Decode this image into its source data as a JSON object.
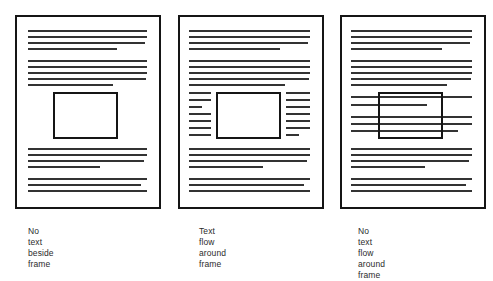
{
  "figure": {
    "type": "diagram",
    "background_color": "#ffffff",
    "line_color": "#333333",
    "border_color": "#151515",
    "panel_count": 3
  },
  "panels": [
    {
      "id": "panel-no-text-beside-frame",
      "caption": "No text beside\nframe",
      "caption_text": "No text beside frame",
      "page": {
        "x": 15,
        "y": 15,
        "width": 146,
        "height": 194
      },
      "frame": {
        "x": 53,
        "y": 92,
        "width": 65,
        "height": 47,
        "filled": true
      },
      "wrap_mode": "none-beside",
      "lines": [
        {
          "x": 28,
          "y": 30,
          "width": 119
        },
        {
          "x": 28,
          "y": 36,
          "width": 119
        },
        {
          "x": 28,
          "y": 42,
          "width": 117
        },
        {
          "x": 28,
          "y": 48,
          "width": 89
        },
        {
          "x": 28,
          "y": 60,
          "width": 119
        },
        {
          "x": 28,
          "y": 66,
          "width": 119
        },
        {
          "x": 28,
          "y": 72,
          "width": 119
        },
        {
          "x": 28,
          "y": 78,
          "width": 118
        },
        {
          "x": 28,
          "y": 84,
          "width": 85
        },
        {
          "x": 28,
          "y": 148,
          "width": 119
        },
        {
          "x": 28,
          "y": 154,
          "width": 119
        },
        {
          "x": 28,
          "y": 160,
          "width": 116
        },
        {
          "x": 28,
          "y": 166,
          "width": 72
        },
        {
          "x": 28,
          "y": 178,
          "width": 119
        },
        {
          "x": 28,
          "y": 184,
          "width": 113
        },
        {
          "x": 28,
          "y": 190,
          "width": 119
        }
      ]
    },
    {
      "id": "panel-text-flow-around-frame",
      "caption": "Text flow around\nframe",
      "caption_text": "Text flow around frame",
      "page": {
        "x": 178,
        "y": 15,
        "width": 146,
        "height": 194
      },
      "frame": {
        "x": 216,
        "y": 92,
        "width": 65,
        "height": 47,
        "filled": true
      },
      "wrap_mode": "around",
      "lines": [
        {
          "x": 189,
          "y": 30,
          "width": 121
        },
        {
          "x": 189,
          "y": 36,
          "width": 121
        },
        {
          "x": 189,
          "y": 42,
          "width": 119
        },
        {
          "x": 189,
          "y": 48,
          "width": 91
        },
        {
          "x": 189,
          "y": 60,
          "width": 121
        },
        {
          "x": 189,
          "y": 66,
          "width": 121
        },
        {
          "x": 189,
          "y": 72,
          "width": 121
        },
        {
          "x": 189,
          "y": 78,
          "width": 120
        },
        {
          "x": 189,
          "y": 84,
          "width": 96
        },
        {
          "x": 189,
          "y": 92,
          "width": 22
        },
        {
          "x": 189,
          "y": 99,
          "width": 22
        },
        {
          "x": 189,
          "y": 106,
          "width": 13
        },
        {
          "x": 189,
          "y": 113,
          "width": 22
        },
        {
          "x": 189,
          "y": 120,
          "width": 22
        },
        {
          "x": 189,
          "y": 127,
          "width": 22
        },
        {
          "x": 189,
          "y": 134,
          "width": 22
        },
        {
          "x": 286,
          "y": 92,
          "width": 24
        },
        {
          "x": 286,
          "y": 99,
          "width": 24
        },
        {
          "x": 286,
          "y": 106,
          "width": 24
        },
        {
          "x": 286,
          "y": 113,
          "width": 24
        },
        {
          "x": 286,
          "y": 120,
          "width": 24
        },
        {
          "x": 286,
          "y": 127,
          "width": 24
        },
        {
          "x": 286,
          "y": 134,
          "width": 13
        },
        {
          "x": 189,
          "y": 148,
          "width": 121
        },
        {
          "x": 189,
          "y": 154,
          "width": 121
        },
        {
          "x": 189,
          "y": 160,
          "width": 118
        },
        {
          "x": 189,
          "y": 166,
          "width": 74
        },
        {
          "x": 189,
          "y": 178,
          "width": 121
        },
        {
          "x": 189,
          "y": 184,
          "width": 115
        },
        {
          "x": 189,
          "y": 190,
          "width": 121
        }
      ]
    },
    {
      "id": "panel-no-text-flow-around-frame",
      "caption": "No text flow around\nframe",
      "caption_text": "No text flow around frame",
      "page": {
        "x": 340,
        "y": 15,
        "width": 146,
        "height": 194
      },
      "frame": {
        "x": 378,
        "y": 92,
        "width": 65,
        "height": 47,
        "filled": false
      },
      "wrap_mode": "through",
      "lines": [
        {
          "x": 351,
          "y": 30,
          "width": 121
        },
        {
          "x": 351,
          "y": 36,
          "width": 121
        },
        {
          "x": 351,
          "y": 42,
          "width": 119
        },
        {
          "x": 351,
          "y": 48,
          "width": 91
        },
        {
          "x": 351,
          "y": 60,
          "width": 121
        },
        {
          "x": 351,
          "y": 66,
          "width": 121
        },
        {
          "x": 351,
          "y": 72,
          "width": 121
        },
        {
          "x": 351,
          "y": 78,
          "width": 120
        },
        {
          "x": 351,
          "y": 84,
          "width": 96
        },
        {
          "x": 351,
          "y": 96,
          "width": 121
        },
        {
          "x": 351,
          "y": 104,
          "width": 76
        },
        {
          "x": 351,
          "y": 116,
          "width": 121
        },
        {
          "x": 351,
          "y": 123,
          "width": 121
        },
        {
          "x": 351,
          "y": 130,
          "width": 107
        },
        {
          "x": 351,
          "y": 148,
          "width": 121
        },
        {
          "x": 351,
          "y": 154,
          "width": 121
        },
        {
          "x": 351,
          "y": 160,
          "width": 118
        },
        {
          "x": 351,
          "y": 166,
          "width": 74
        },
        {
          "x": 351,
          "y": 178,
          "width": 121
        },
        {
          "x": 351,
          "y": 184,
          "width": 115
        },
        {
          "x": 351,
          "y": 190,
          "width": 121
        }
      ]
    }
  ],
  "captions": {
    "positions": [
      {
        "x": 28,
        "y": 226
      },
      {
        "x": 199,
        "y": 226
      },
      {
        "x": 358,
        "y": 226
      }
    ]
  }
}
